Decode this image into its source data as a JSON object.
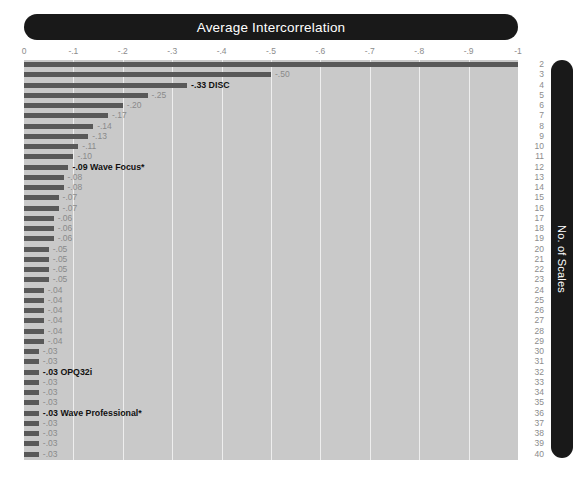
{
  "chart_data": {
    "type": "bar",
    "orientation": "horizontal",
    "title": "Average Intercorrelation",
    "xlabel": "",
    "ylabel": "No. of Scales",
    "xlim": [
      0,
      -1.0
    ],
    "xticks": [
      "0",
      "-.1",
      "-.2",
      "-.3",
      "-.4",
      "-.5",
      "-.6",
      "-.7",
      "-.8",
      "-.9",
      "-1"
    ],
    "xtick_values": [
      0,
      -0.1,
      -0.2,
      -0.3,
      -0.4,
      -0.5,
      -0.6,
      -0.7,
      -0.8,
      -0.9,
      -1.0
    ],
    "grid": true,
    "legend": null,
    "categories": [
      2,
      3,
      4,
      5,
      6,
      7,
      8,
      9,
      10,
      11,
      12,
      13,
      14,
      15,
      16,
      17,
      18,
      19,
      20,
      21,
      22,
      23,
      24,
      25,
      26,
      27,
      28,
      29,
      30,
      31,
      32,
      33,
      34,
      35,
      36,
      37,
      38,
      39,
      40
    ],
    "values": [
      -1.0,
      -0.5,
      -0.33,
      -0.25,
      -0.2,
      -0.17,
      -0.14,
      -0.13,
      -0.11,
      -0.1,
      -0.09,
      -0.08,
      -0.08,
      -0.07,
      -0.07,
      -0.06,
      -0.06,
      -0.06,
      -0.05,
      -0.05,
      -0.05,
      -0.05,
      -0.04,
      -0.04,
      -0.04,
      -0.04,
      -0.04,
      -0.04,
      -0.03,
      -0.03,
      -0.03,
      -0.03,
      -0.03,
      -0.03,
      -0.03,
      -0.03,
      -0.03,
      -0.03,
      -0.03
    ],
    "data_labels": [
      "",
      "-.50",
      "-.33",
      "-.25",
      "-.20",
      "-.17",
      "-.14",
      "-.13",
      "-.11",
      "-.10",
      "-.09",
      "-.08",
      "-.08",
      "-.07",
      "-.07",
      "-.06",
      "-.06",
      "-.06",
      "-.05",
      "-.05",
      "-.05",
      "-.05",
      "-.04",
      "-.04",
      "-.04",
      "-.04",
      "-.04",
      "-.04",
      "-.03",
      "-.03",
      "-.03",
      "-.03",
      "-.03",
      "-.03",
      "-.03",
      "-.03",
      "-.03",
      "-.03",
      "-.03"
    ],
    "annotations": [
      {
        "index": 2,
        "text": "-.33  DISC"
      },
      {
        "index": 10,
        "text": "-.09 Wave Focus*"
      },
      {
        "index": 30,
        "text": "-.03 OPQ32i"
      },
      {
        "index": 34,
        "text": "-.03 Wave Professional*"
      }
    ],
    "colors": {
      "bar": "#595959",
      "plot_background": "#c9c9c9",
      "gridline": "#eeeeee",
      "title_bar": "#191919",
      "title_text": "#ffffff",
      "tick_text": "#8c8c8c",
      "label_text": "#8a8a8a",
      "annotation_text": "#111111"
    }
  }
}
